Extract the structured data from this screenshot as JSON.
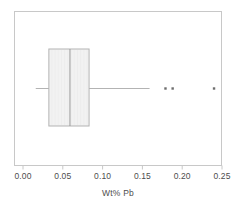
{
  "chart_data": {
    "type": "box",
    "title": "",
    "xlabel": "Wt% Pb",
    "ylabel": "",
    "xlim": [
      0.0,
      0.2625
    ],
    "xticks": [
      0.0,
      0.05,
      0.1,
      0.15,
      0.2,
      0.25
    ],
    "xticklabels": [
      "0.00",
      "0.05",
      "0.10",
      "0.15",
      "0.20",
      "0.25"
    ],
    "grid": false,
    "legend": null,
    "orientation": "horizontal",
    "boxes": [
      {
        "name": "Wt% Pb",
        "whisker_low": 0.016,
        "q1": 0.0325,
        "median": 0.059,
        "q3": 0.083,
        "whisker_high": 0.159,
        "outliers": [
          0.179,
          0.188,
          0.24
        ]
      }
    ],
    "style": {
      "box_fill": "#f2f2f2",
      "box_edge": "#b3b3b3",
      "median_color": "#9a9a9a",
      "whisker_color": "#b3b3b3",
      "outlier_color": "#6e6e6e",
      "frame_color": "#c8c8c8",
      "tick_color": "#c8c8c8",
      "text_color": "#4d4d4d",
      "background": "#ffffff"
    }
  }
}
